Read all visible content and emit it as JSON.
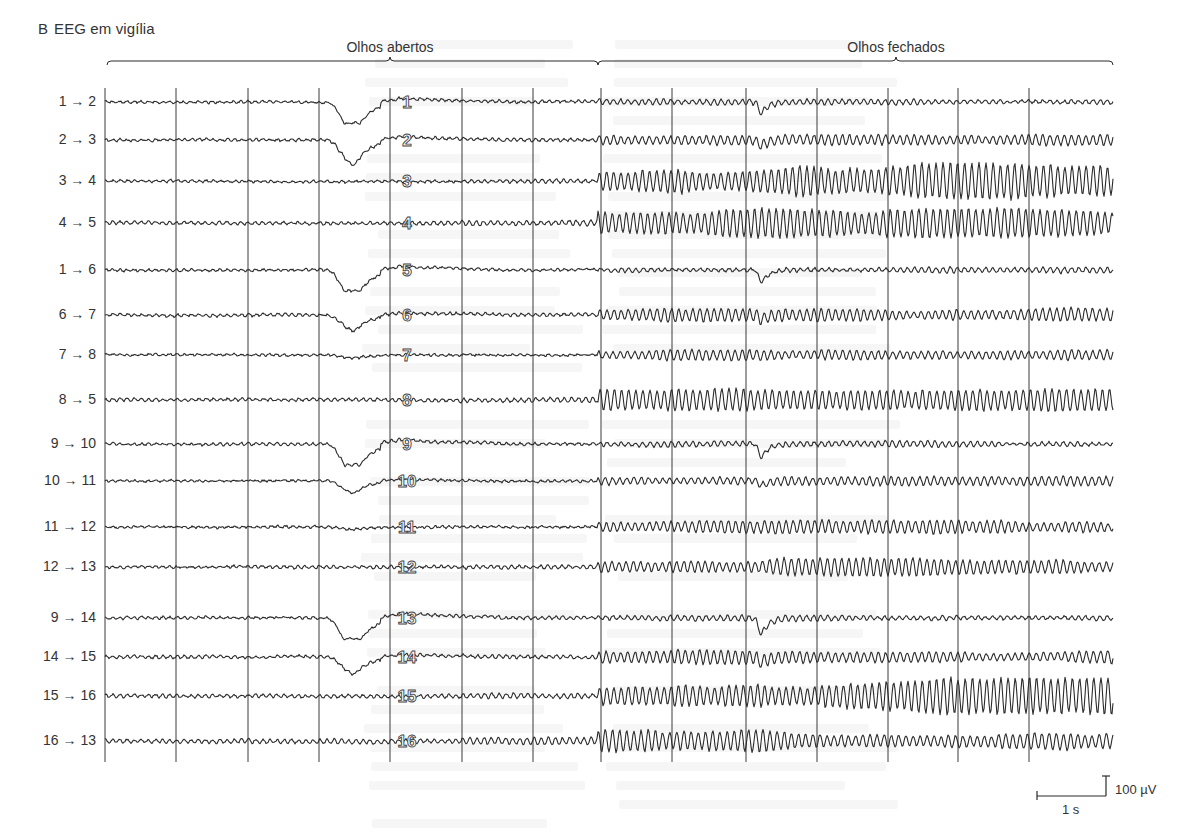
{
  "figure": {
    "panel_letter": "B",
    "panel_title": "EEG em vigília",
    "brackets": [
      {
        "label": "Olhos abertos",
        "x1": 107,
        "x2": 598,
        "mid": 390
      },
      {
        "label": "Olhos fechados",
        "x1": 598,
        "x2": 1113,
        "mid": 896
      }
    ],
    "scale_bar": {
      "time_label": "1 s",
      "amplitude_label": "100 µV"
    }
  },
  "chart_data": {
    "type": "line",
    "title": "EEG em vigília",
    "subtitle": "Registro bipolar de 16 canais; atividade alfa aparece ao fechar os olhos",
    "xlabel": "Tempo",
    "ylabel": "Potencial (µV)",
    "conditions": [
      {
        "label": "Olhos abertos",
        "x_start_s": 0,
        "x_end_s": 6.85
      },
      {
        "label": "Olhos fechados",
        "x_start_s": 6.85,
        "x_end_s": 14.0
      }
    ],
    "time_gridlines_s": [
      0,
      1,
      2,
      3,
      4,
      5,
      6,
      7,
      8,
      9,
      10,
      11,
      12,
      13,
      14
    ],
    "scale": {
      "time": "1 s",
      "amplitude": "100 µV"
    },
    "grid": true,
    "legend": "none",
    "series": [
      {
        "name": "1 → 2",
        "electrode_number": "1",
        "blink_open_uV": -110,
        "blink_closed_uV": -40,
        "alpha_uV_open": 4,
        "alpha_uV_closed": 8
      },
      {
        "name": "2 → 3",
        "electrode_number": "2",
        "blink_open_uV": -90,
        "blink_closed_uV": -20,
        "alpha_uV_open": 4,
        "alpha_uV_closed": 15
      },
      {
        "name": "3 → 4",
        "electrode_number": "3",
        "blink_open_uV": 0,
        "blink_closed_uV": 0,
        "alpha_uV_open": 4,
        "alpha_uV_closed": 50
      },
      {
        "name": "4 → 5",
        "electrode_number": "4",
        "blink_open_uV": 0,
        "blink_closed_uV": 0,
        "alpha_uV_open": 6,
        "alpha_uV_closed": 40
      },
      {
        "name": "1 → 6",
        "electrode_number": "5",
        "blink_open_uV": -110,
        "blink_closed_uV": -45,
        "alpha_uV_open": 4,
        "alpha_uV_closed": 8
      },
      {
        "name": "6 → 7",
        "electrode_number": "6",
        "blink_open_uV": -55,
        "blink_closed_uV": -15,
        "alpha_uV_open": 4,
        "alpha_uV_closed": 18
      },
      {
        "name": "7 → 8",
        "electrode_number": "7",
        "blink_open_uV": -10,
        "blink_closed_uV": 0,
        "alpha_uV_open": 3,
        "alpha_uV_closed": 20
      },
      {
        "name": "8 → 5",
        "electrode_number": "8",
        "blink_open_uV": 0,
        "blink_closed_uV": 0,
        "alpha_uV_open": 5,
        "alpha_uV_closed": 30
      },
      {
        "name": "9 → 10",
        "electrode_number": "9",
        "blink_open_uV": -110,
        "blink_closed_uV": -45,
        "alpha_uV_open": 4,
        "alpha_uV_closed": 8
      },
      {
        "name": "10 → 11",
        "electrode_number": "10",
        "blink_open_uV": -45,
        "blink_closed_uV": -15,
        "alpha_uV_open": 3,
        "alpha_uV_closed": 12
      },
      {
        "name": "11 → 12",
        "electrode_number": "11",
        "blink_open_uV": -8,
        "blink_closed_uV": 0,
        "alpha_uV_open": 3,
        "alpha_uV_closed": 18
      },
      {
        "name": "12 → 13",
        "electrode_number": "12",
        "blink_open_uV": 0,
        "blink_closed_uV": 0,
        "alpha_uV_open": 4,
        "alpha_uV_closed": 25
      },
      {
        "name": "9 → 14",
        "electrode_number": "13",
        "blink_open_uV": -120,
        "blink_closed_uV": -55,
        "alpha_uV_open": 4,
        "alpha_uV_closed": 8
      },
      {
        "name": "14 → 15",
        "electrode_number": "14",
        "blink_open_uV": -60,
        "blink_closed_uV": -20,
        "alpha_uV_open": 5,
        "alpha_uV_closed": 20
      },
      {
        "name": "15 → 16",
        "electrode_number": "15",
        "blink_open_uV": 0,
        "blink_closed_uV": 0,
        "alpha_uV_open": 6,
        "alpha_uV_closed": 50
      },
      {
        "name": "16 → 13",
        "electrode_number": "16",
        "blink_open_uV": 0,
        "blink_closed_uV": 0,
        "alpha_uV_open": 7,
        "alpha_uV_closed": 30
      }
    ]
  },
  "layout": {
    "row_y": [
      102,
      140,
      181,
      223,
      270,
      315,
      355,
      400,
      444,
      481,
      527,
      567,
      618,
      657,
      696,
      741
    ],
    "grid_x": [
      105,
      176,
      248,
      319,
      390,
      462,
      533,
      601,
      672,
      746,
      817,
      888,
      958,
      1029
    ],
    "trace_x_start": 105,
    "trace_x_end": 1113,
    "grid_y_top": 88,
    "grid_y_bottom": 762,
    "blink_open_x": 355,
    "blink_closed_x": 762,
    "eyes_close_x": 598,
    "electrode_label_x": 407,
    "px_per_100uV": 28,
    "px_per_second": 71.5,
    "colors": {
      "ink": "#2b2b2b",
      "grid": "#3a3a3a",
      "text": "#333333",
      "bleed": "#000000"
    }
  }
}
